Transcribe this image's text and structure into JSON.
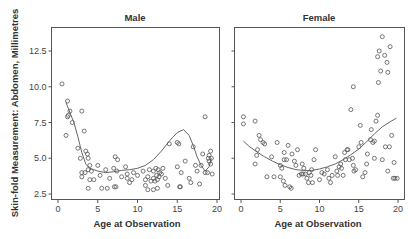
{
  "chart_data": {
    "type": "scatter",
    "ylabel": "Skin-fold Measurement: Abdomen, Millimetres",
    "ylim": [
      2.2,
      14.0
    ],
    "yticks": [
      2.5,
      5.0,
      7.5,
      10.0,
      12.5
    ],
    "ytick_labels": [
      "2.5",
      "5.0",
      "7.5",
      "10.0",
      "12.5"
    ],
    "xticks": [
      0,
      5,
      10,
      15,
      20
    ],
    "xtick_labels": [
      "0",
      "5",
      "10",
      "15",
      "20"
    ],
    "xlim": [
      -0.9,
      20.2
    ],
    "grid": false,
    "legend": null,
    "panels": [
      {
        "title": "Male",
        "xlabel": "Age at Observation",
        "points": [
          [
            0.5,
            10.2
          ],
          [
            1.0,
            6.6
          ],
          [
            1.2,
            7.9
          ],
          [
            1.3,
            8.0
          ],
          [
            1.5,
            8.3
          ],
          [
            1.2,
            9.0
          ],
          [
            1.8,
            7.5
          ],
          [
            3.0,
            8.3
          ],
          [
            2.5,
            5.7
          ],
          [
            2.8,
            5.0
          ],
          [
            3.0,
            4.0
          ],
          [
            3.3,
            6.9
          ],
          [
            3.5,
            5.5
          ],
          [
            3.7,
            5.3
          ],
          [
            3.8,
            5.0
          ],
          [
            3.0,
            3.7
          ],
          [
            3.4,
            4.0
          ],
          [
            3.8,
            4.2
          ],
          [
            4.0,
            4.5
          ],
          [
            4.2,
            4.1
          ],
          [
            4.0,
            3.5
          ],
          [
            4.5,
            3.5
          ],
          [
            3.8,
            2.9
          ],
          [
            5.0,
            4.5
          ],
          [
            5.3,
            3.8
          ],
          [
            5.5,
            2.9
          ],
          [
            6.0,
            4.2
          ],
          [
            6.2,
            2.9
          ],
          [
            6.5,
            3.6
          ],
          [
            7.0,
            4.3
          ],
          [
            7.1,
            3.0
          ],
          [
            7.3,
            3.0
          ],
          [
            7.2,
            5.1
          ],
          [
            7.5,
            4.9
          ],
          [
            7.4,
            4.1
          ],
          [
            8.0,
            3.7
          ],
          [
            8.5,
            4.4
          ],
          [
            8.7,
            3.9
          ],
          [
            8.7,
            3.6
          ],
          [
            9.0,
            3.3
          ],
          [
            9.5,
            4.0
          ],
          [
            9.3,
            3.5
          ],
          [
            10.0,
            3.8
          ],
          [
            10.7,
            4.1
          ],
          [
            11.0,
            3.5
          ],
          [
            11.0,
            3.1
          ],
          [
            11.3,
            3.7
          ],
          [
            11.5,
            4.2
          ],
          [
            11.7,
            3.4
          ],
          [
            12.0,
            4.1
          ],
          [
            12.0,
            3.6
          ],
          [
            12.2,
            3.4
          ],
          [
            12.3,
            4.3
          ],
          [
            12.4,
            3.8
          ],
          [
            12.5,
            3.5
          ],
          [
            12.6,
            4.2
          ],
          [
            12.7,
            3.7
          ],
          [
            12.5,
            2.9
          ],
          [
            12.8,
            4.0
          ],
          [
            13.0,
            3.9
          ],
          [
            13.2,
            4.3
          ],
          [
            13.5,
            3.6
          ],
          [
            13.8,
            3.1
          ],
          [
            12.0,
            2.8
          ],
          [
            11.3,
            2.8
          ],
          [
            14.0,
            6.0
          ],
          [
            15.0,
            6.1
          ],
          [
            15.2,
            6.0
          ],
          [
            15.0,
            4.4
          ],
          [
            15.3,
            3.0
          ],
          [
            15.4,
            3.0
          ],
          [
            15.5,
            4.0
          ],
          [
            16.0,
            4.8
          ],
          [
            16.5,
            3.6
          ],
          [
            16.7,
            3.3
          ],
          [
            17.0,
            5.8
          ],
          [
            17.3,
            4.5
          ],
          [
            17.5,
            4.1
          ],
          [
            17.8,
            3.2
          ],
          [
            18.0,
            4.5
          ],
          [
            18.2,
            5.3
          ],
          [
            18.5,
            4.0
          ],
          [
            18.8,
            4.0
          ],
          [
            18.5,
            7.9
          ],
          [
            19.0,
            5.2
          ],
          [
            19.2,
            5.5
          ],
          [
            19.0,
            4.8
          ],
          [
            19.2,
            4.6
          ],
          [
            19.4,
            3.9
          ],
          [
            18.9,
            5.0
          ],
          [
            19.3,
            5.0
          ]
        ],
        "curve": [
          [
            1.0,
            8.9
          ],
          [
            1.5,
            8.2
          ],
          [
            2.0,
            7.5
          ],
          [
            2.5,
            6.5
          ],
          [
            3.0,
            5.4
          ],
          [
            3.5,
            4.6
          ],
          [
            4.0,
            4.3
          ],
          [
            5.0,
            4.1
          ],
          [
            6.0,
            4.0
          ],
          [
            7.0,
            4.05
          ],
          [
            8.0,
            4.15
          ],
          [
            9.0,
            4.2
          ],
          [
            10.0,
            4.3
          ],
          [
            11.0,
            4.5
          ],
          [
            12.0,
            4.9
          ],
          [
            13.0,
            5.5
          ],
          [
            14.0,
            6.2
          ],
          [
            15.0,
            6.8
          ],
          [
            15.8,
            7.0
          ],
          [
            16.5,
            6.6
          ],
          [
            17.0,
            5.9
          ],
          [
            17.5,
            5.1
          ],
          [
            18.0,
            4.5
          ],
          [
            18.5,
            4.1
          ],
          [
            19.0,
            4.4
          ],
          [
            19.3,
            5.0
          ]
        ]
      },
      {
        "title": "Female",
        "xlabel": "Age at Observation",
        "points": [
          [
            0.3,
            7.9
          ],
          [
            0.3,
            7.4
          ],
          [
            1.8,
            7.6
          ],
          [
            2.3,
            6.6
          ],
          [
            2.5,
            6.3
          ],
          [
            2.8,
            6.1
          ],
          [
            3.0,
            6.0
          ],
          [
            2.1,
            5.6
          ],
          [
            2.0,
            5.2
          ],
          [
            1.8,
            4.6
          ],
          [
            3.3,
            3.7
          ],
          [
            3.9,
            5.1
          ],
          [
            4.2,
            3.7
          ],
          [
            4.6,
            6.1
          ],
          [
            5.0,
            4.5
          ],
          [
            5.0,
            3.7
          ],
          [
            5.2,
            4.3
          ],
          [
            5.4,
            3.4
          ],
          [
            5.6,
            3.1
          ],
          [
            5.5,
            4.9
          ],
          [
            5.5,
            5.4
          ],
          [
            5.8,
            4.9
          ],
          [
            6.0,
            5.9
          ],
          [
            6.2,
            3.0
          ],
          [
            6.4,
            2.9
          ],
          [
            6.5,
            5.3
          ],
          [
            6.8,
            4.8
          ],
          [
            7.0,
            4.5
          ],
          [
            7.2,
            5.6
          ],
          [
            7.4,
            3.8
          ],
          [
            7.7,
            3.9
          ],
          [
            7.8,
            4.6
          ],
          [
            7.9,
            3.9
          ],
          [
            8.0,
            4.3
          ],
          [
            8.2,
            3.9
          ],
          [
            8.4,
            3.6
          ],
          [
            8.6,
            3.3
          ],
          [
            8.7,
            4.0
          ],
          [
            8.9,
            3.8
          ],
          [
            9.0,
            4.2
          ],
          [
            9.1,
            3.3
          ],
          [
            9.3,
            4.9
          ],
          [
            9.5,
            5.6
          ],
          [
            10.0,
            3.5
          ],
          [
            10.3,
            4.0
          ],
          [
            10.6,
            3.9
          ],
          [
            11.0,
            4.2
          ],
          [
            11.2,
            3.6
          ],
          [
            11.4,
            3.3
          ],
          [
            11.6,
            3.8
          ],
          [
            12.0,
            5.1
          ],
          [
            12.2,
            4.1
          ],
          [
            12.3,
            3.8
          ],
          [
            12.5,
            4.4
          ],
          [
            12.7,
            4.6
          ],
          [
            12.8,
            4.3
          ],
          [
            13.0,
            3.8
          ],
          [
            13.2,
            5.4
          ],
          [
            13.3,
            4.9
          ],
          [
            13.5,
            5.6
          ],
          [
            13.6,
            5.6
          ],
          [
            13.8,
            4.9
          ],
          [
            14.0,
            8.4
          ],
          [
            14.3,
            10.0
          ],
          [
            14.2,
            5.0
          ],
          [
            14.3,
            4.5
          ],
          [
            14.4,
            4.1
          ],
          [
            14.6,
            4.2
          ],
          [
            15.0,
            5.8
          ],
          [
            15.2,
            7.3
          ],
          [
            15.3,
            6.1
          ],
          [
            15.5,
            3.7
          ],
          [
            15.8,
            4.0
          ],
          [
            16.0,
            4.6
          ],
          [
            16.1,
            5.3
          ],
          [
            16.5,
            6.3
          ],
          [
            16.6,
            7.0
          ],
          [
            16.8,
            6.1
          ],
          [
            17.0,
            5.0
          ],
          [
            17.0,
            6.2
          ],
          [
            17.2,
            7.6
          ],
          [
            17.4,
            8.0
          ],
          [
            17.5,
            10.3
          ],
          [
            17.8,
            11.1
          ],
          [
            17.4,
            12.1
          ],
          [
            17.6,
            12.5
          ],
          [
            18.0,
            13.5
          ],
          [
            18.3,
            12.2
          ],
          [
            18.6,
            11.7
          ],
          [
            18.7,
            11.0
          ],
          [
            19.0,
            12.8
          ],
          [
            18.0,
            4.9
          ],
          [
            18.4,
            5.8
          ],
          [
            18.9,
            5.8
          ],
          [
            19.2,
            6.6
          ],
          [
            19.5,
            4.7
          ],
          [
            19.6,
            3.6
          ],
          [
            19.9,
            3.6
          ],
          [
            19.4,
            3.6
          ],
          [
            18.7,
            4.1
          ]
        ],
        "curve": [
          [
            0.3,
            6.2
          ],
          [
            1.0,
            5.85
          ],
          [
            2.0,
            5.45
          ],
          [
            3.0,
            5.1
          ],
          [
            4.0,
            4.8
          ],
          [
            5.0,
            4.55
          ],
          [
            6.0,
            4.35
          ],
          [
            7.0,
            4.2
          ],
          [
            8.0,
            4.15
          ],
          [
            9.0,
            4.15
          ],
          [
            10.0,
            4.25
          ],
          [
            11.0,
            4.4
          ],
          [
            12.0,
            4.6
          ],
          [
            13.0,
            4.9
          ],
          [
            14.0,
            5.25
          ],
          [
            15.0,
            5.65
          ],
          [
            16.0,
            6.15
          ],
          [
            17.0,
            6.7
          ],
          [
            18.0,
            7.2
          ],
          [
            19.0,
            7.55
          ],
          [
            19.8,
            7.8
          ]
        ]
      }
    ]
  }
}
